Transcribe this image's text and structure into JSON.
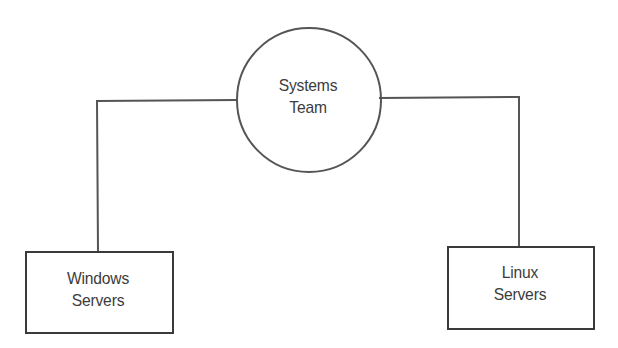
{
  "diagram": {
    "type": "hierarchy",
    "root": {
      "id": "systems-team",
      "shape": "circle",
      "label_lines": [
        "Systems",
        "Team"
      ]
    },
    "children": [
      {
        "id": "windows-servers",
        "shape": "rectangle",
        "label_lines": [
          "Windows",
          "Servers"
        ]
      },
      {
        "id": "linux-servers",
        "shape": "rectangle",
        "label_lines": [
          "Linux",
          "Servers"
        ]
      }
    ],
    "edges": [
      {
        "from": "systems-team",
        "to": "windows-servers"
      },
      {
        "from": "systems-team",
        "to": "linux-servers"
      }
    ],
    "colors": {
      "line": "#555555",
      "text": "#3c3c3c",
      "background": "#ffffff"
    }
  }
}
